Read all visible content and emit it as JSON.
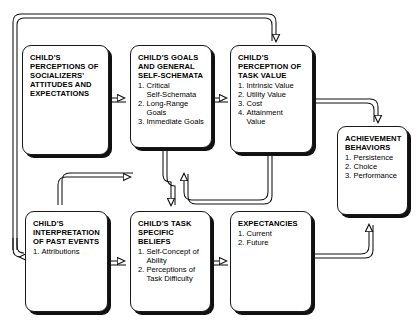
{
  "diagram": {
    "type": "flowchart",
    "stroke_color": "#1a1a1a",
    "shadow_color": "#111111",
    "background_color": "#ffffff",
    "nodes": [
      {
        "id": "perceptions",
        "title": "CHILD'S\nPERCEPTIONS OF\nSOCIALIZERS'\nATTITUDES AND\nEXPECTATIONS",
        "items": []
      },
      {
        "id": "goals",
        "title": "CHILD'S GOALS\nAND GENERAL\nSELF-SCHEMATA",
        "items": [
          {
            "num": "1.",
            "text": "Critical\nSelf-Schemata"
          },
          {
            "num": "2.",
            "text": "Long-Range\nGoals"
          },
          {
            "num": "3.",
            "text": "Immediate Goals"
          }
        ]
      },
      {
        "id": "task-value",
        "title": "CHILD'S\nPERCEPTION OF\nTASK VALUE",
        "items": [
          {
            "num": "1.",
            "text": "Intrinsic Value"
          },
          {
            "num": "2.",
            "text": "Utility Value"
          },
          {
            "num": "3.",
            "text": "Cost"
          },
          {
            "num": "4.",
            "text": "Attainment\nValue"
          }
        ]
      },
      {
        "id": "achievement",
        "title": "ACHIEVEMENT\nBEHAVIORS",
        "items": [
          {
            "num": "1.",
            "text": "Persistence"
          },
          {
            "num": "2.",
            "text": "Choice"
          },
          {
            "num": "3.",
            "text": "Performance"
          }
        ]
      },
      {
        "id": "interpretation",
        "title": "CHILD'S\nINTERPRETATION\nOF PAST EVENTS",
        "items": [
          {
            "num": "1.",
            "text": "Attributions"
          }
        ]
      },
      {
        "id": "task-beliefs",
        "title": "CHILD'S TASK\nSPECIFIC BELIEFS",
        "items": [
          {
            "num": "1.",
            "text": "Self-Concept of\nAbility"
          },
          {
            "num": "2.",
            "text": "Perceptions of\nTask Difficulty"
          }
        ]
      },
      {
        "id": "expectancies",
        "title": "EXPECTANCIES",
        "items": [
          {
            "num": "1.",
            "text": "Current"
          },
          {
            "num": "2.",
            "text": "Future"
          }
        ]
      }
    ]
  }
}
